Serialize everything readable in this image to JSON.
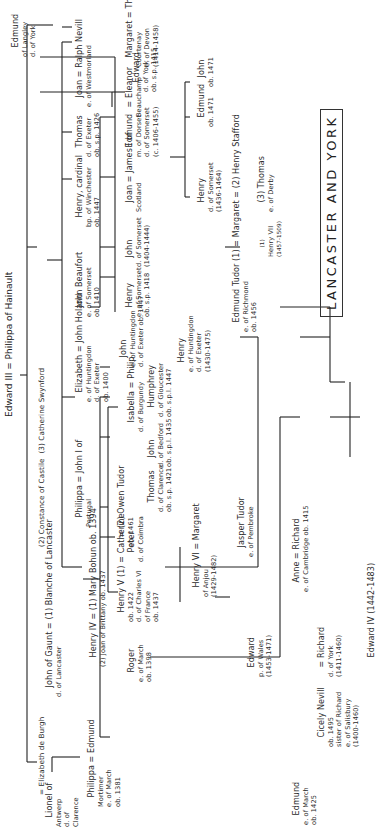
{
  "title": "LANCASTER AND YORK",
  "orientation": "rotated 90 degrees counter-clockwise",
  "root": "Edward III = Philippa of Hainault",
  "tree": {
    "wives_line": "John of Gaunt = (1) Blanche of Lancaster (2) Constance of Castile (3) Catherine Swynford",
    "nodes": {
      "lionel": [
        "Lionel of",
        "Antwerp",
        "d. of",
        "Clarence"
      ],
      "elizabeth_burgh": "= Elizabeth de Burgh",
      "john_gaunt": [
        "John of Gaunt = (1) Blanche of Lancaster",
        "d. of Lancaster"
      ],
      "wives_23": "(2) Constance of Castile  (3) Catherine Swynford",
      "edmund_langley": [
        "Edmund",
        "of Langley",
        "d. of York"
      ],
      "philippa_edmund": [
        "Philippa = Edmund",
        "Mortimer",
        "e. of March",
        "ob. 1381"
      ],
      "henry_iv": [
        "Henry IV = (1) Mary Bohun ob. 1394",
        "(2) Joan of Brittany ob. 1437"
      ],
      "philippa_john": [
        "Philippa = John I of",
        "Portugal"
      ],
      "elizabeth_holand": [
        "Elizabeth = John Holand",
        "e. of Huntingdon",
        "d. of Exeter",
        "ob. 1400"
      ],
      "john_beaufort": [
        "John Beaufort",
        "e. of Somerset",
        "ob. 1410"
      ],
      "henry_cardinal": [
        "Henry, cardinal",
        "bp. of Winchester",
        "ob. 1447"
      ],
      "thomas_exeter": [
        "Thomas",
        "d. of Exeter",
        "ob. s.p. 1426"
      ],
      "joan_nevill": [
        "Joan = Ralph Nevill",
        "e. of Westmorland"
      ],
      "roger": [
        "Roger",
        "e. of March",
        "ob. 1398"
      ],
      "henry_v": [
        "Henry V (1) = Catherine",
        "ob. 1422",
        "d. of Charles VI",
        "of France",
        "ob. 1437"
      ],
      "owen_tudor": [
        "= (2) Owen Tudor",
        "ob. 1461"
      ],
      "peter": [
        "Peter",
        "d. of Coimbra"
      ],
      "isabella": [
        "Isabella = Philip",
        "d. of Burgundy"
      ],
      "thomas_clarence": [
        "Thomas",
        "d. of Clarence",
        "ob. s.p. 1421"
      ],
      "john_bedford": [
        "John",
        "d. of Bedford",
        "ob. s.p.l. 1435"
      ],
      "humphrey": [
        "Humphrey",
        "d. of Gloucester",
        "ob. s.p.l. 1447"
      ],
      "john_huntingdon": [
        "John",
        "e. of Huntingdon",
        "d. of Exeter ob. 1447"
      ],
      "henry_somerset": [
        "Henry",
        "e. of Somerset",
        "ob. s.p. 1418"
      ],
      "john_somerset": [
        "John",
        "d. of Somerset",
        "(1404-1444)"
      ],
      "joan_james": [
        "Joan = James I of",
        "Scotland"
      ],
      "edmund_dorset": [
        "Edmund",
        "m. of Dorset",
        "d. of Somerset",
        "(c. 1406-1455)"
      ],
      "eleanor": [
        "= Eleanor",
        "Beauchamp"
      ],
      "margaret_courtenay": [
        "Margaret = Thomas",
        "Courtenay",
        "e. of Devon",
        "(1414-1458)"
      ],
      "henry_vi": [
        "Henry VI = Margaret",
        "of Anjou",
        "(1429-1482)"
      ],
      "jasper": [
        "Jasper Tudor",
        "e. of Pembroke"
      ],
      "henry_exeter": [
        "Henry",
        "e. of Huntingdon",
        "d. of Exeter",
        "(1430-1475)"
      ],
      "edmund_tudor": [
        "Edmund Tudor (1) = Margaret = (2) Henry Stafford",
        "e. of Richmond",
        "ob. 1456"
      ],
      "thomas_derby": [
        "(3) Thomas",
        "e. of Derby"
      ],
      "henry_somerset2": [
        "Henry",
        "d. of Somerset",
        "(1436-1464)"
      ],
      "edmund_1471": [
        "Edmund",
        "ob. 1471"
      ],
      "john_1471": [
        "John",
        "ob. 1471"
      ],
      "edward_york": [
        "Edward",
        "d. of York",
        "ob. s.p. 1415"
      ],
      "edmund_march": [
        "Edmund",
        "e. of March",
        "ob. 1425"
      ],
      "anne_richard": [
        "Anne = Richard",
        "e. of Cambridge ob. 1415"
      ],
      "edward_wales": [
        "Edward",
        "p. of Wales",
        "(1453-1471)"
      ],
      "henry_vii": [
        "(1)",
        "Henry VII",
        "(1457-1509)"
      ],
      "cicely": [
        "Cicely Nevill",
        "ob. 1495",
        "sister of Richard",
        "e. of Salisbury",
        "(1400-1460)"
      ],
      "richard_york": [
        "= Richard",
        "d. of York",
        "(1411-1460)"
      ],
      "edward_iv": "Edward IV (1442-1483)"
    }
  }
}
